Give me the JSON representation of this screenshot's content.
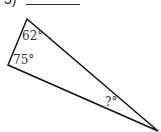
{
  "problem": {
    "number_label": "5)",
    "answer_blank": ""
  },
  "triangle": {
    "vertices": {
      "top": [
        27,
        19
      ],
      "left": [
        8,
        65
      ],
      "right": [
        158,
        131
      ]
    },
    "angles": {
      "top": "62°",
      "left": "75°",
      "right": "?°"
    },
    "stroke_color": "#111111"
  }
}
